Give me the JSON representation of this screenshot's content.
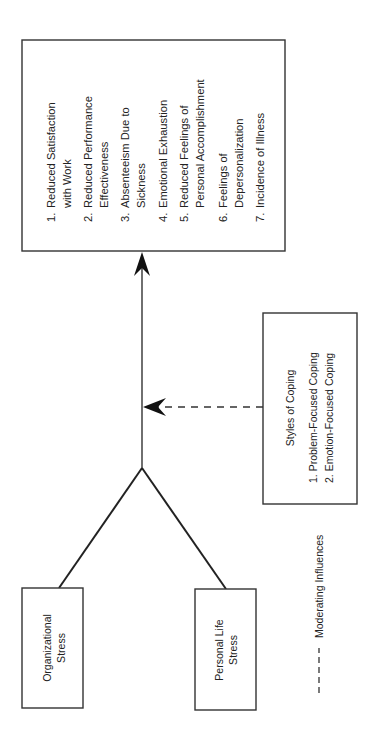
{
  "diagram": {
    "orientation": "rotated-90-ccw",
    "colors": {
      "stroke": "#333333",
      "text": "#222222",
      "background": "#ffffff"
    },
    "outcomes_box": {
      "items": [
        {
          "num": "1.",
          "lines": [
            "Reduced Satisfaction",
            "with Work"
          ]
        },
        {
          "num": "2.",
          "lines": [
            "Reduced Performance",
            "Effectiveness"
          ]
        },
        {
          "num": "3.",
          "lines": [
            "Absenteeism Due to",
            "Sickness"
          ]
        },
        {
          "num": "4.",
          "lines": [
            "Emotional Exhaustion"
          ]
        },
        {
          "num": "5.",
          "lines": [
            "Reduced Feelings of",
            "Personal Accomplishment"
          ]
        },
        {
          "num": "6.",
          "lines": [
            "Feelings of",
            "Depersonalization"
          ]
        },
        {
          "num": "7.",
          "lines": [
            "Incidence of Illness"
          ]
        }
      ]
    },
    "coping_box": {
      "title": "Styles of Coping",
      "items": [
        "1. Problem-Focused Coping",
        "2. Emotion-Focused Coping"
      ]
    },
    "source_boxes": [
      {
        "lines": [
          "Organizational",
          "Stress"
        ]
      },
      {
        "lines": [
          "Personal Life",
          "Stress"
        ]
      }
    ],
    "legend": {
      "symbol": "dashed-line",
      "label": "Moderating Influences"
    }
  }
}
